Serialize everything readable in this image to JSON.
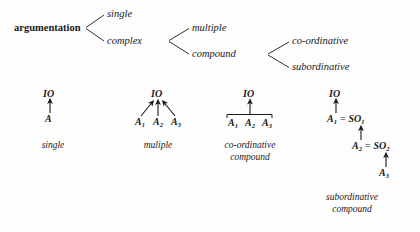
{
  "figure": {
    "background_color": "#fdfdfd",
    "ink_color": "#1a1a1a"
  },
  "taxonomy_tree": {
    "root": {
      "label": "argumentation",
      "style": "roman-bold"
    },
    "level1": [
      {
        "label": "single"
      },
      {
        "label": "complex"
      }
    ],
    "level2": [
      {
        "label": "multiple"
      },
      {
        "label": "compound"
      }
    ],
    "level3": [
      {
        "label": "co-ordinative"
      },
      {
        "label": "subordinative"
      }
    ]
  },
  "structure_diagrams": [
    {
      "name": "single",
      "caption_lines": [
        "single"
      ],
      "conclusion": "IO",
      "premises": [
        "A"
      ],
      "arrows": 1,
      "has_convergence_bar": false
    },
    {
      "name": "multiple",
      "caption_lines": [
        "muliple"
      ],
      "conclusion": "IO",
      "premises": [
        "A",
        "A",
        "A"
      ],
      "premise_subscripts": [
        "1",
        "2",
        "3"
      ],
      "arrows": 3,
      "has_convergence_bar": false
    },
    {
      "name": "co-ordinative-compound",
      "caption_lines": [
        "co-ordinative",
        "compound"
      ],
      "conclusion": "IO",
      "premises": [
        "A",
        "A",
        "A"
      ],
      "premise_subscripts": [
        "1",
        "2",
        "3"
      ],
      "arrows": 1,
      "has_convergence_bar": true
    },
    {
      "name": "subordinative-compound",
      "caption_lines": [
        "subordinative",
        "compound"
      ],
      "conclusion": "IO",
      "chain": [
        {
          "premise": "A",
          "premise_subscript": "1",
          "equals": "=",
          "subconclusion": "SO",
          "subconclusion_subscript": "1"
        },
        {
          "premise": "A",
          "premise_subscript": "2",
          "equals": "=",
          "subconclusion": "SO",
          "subconclusion_subscript": "2"
        },
        {
          "premise": "A",
          "premise_subscript": "3"
        }
      ],
      "arrows": 3,
      "has_convergence_bar": false
    }
  ]
}
